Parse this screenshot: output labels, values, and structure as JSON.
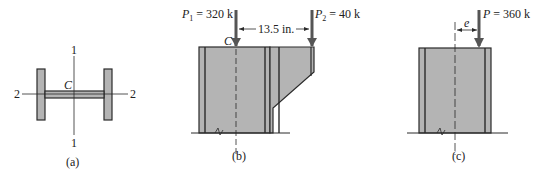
{
  "figure_a": {
    "caption": "(a)",
    "centroid_label": "C",
    "axis1_top": "1",
    "axis1_bottom": "1",
    "axis2_left": "2",
    "axis2_right": "2"
  },
  "figure_b": {
    "caption": "(b)",
    "centroid_label": "C",
    "load1_symbol": "P",
    "load1_sub": "1",
    "load1_value": " = 320 k",
    "load2_symbol": "P",
    "load2_sub": "2",
    "load2_value": " = 40 k",
    "distance": "13.5 in."
  },
  "figure_c": {
    "caption": "(c)",
    "load_symbol": "P",
    "load_value": " = 360 k",
    "eccentricity_label": "e"
  },
  "colors": {
    "fill": "#b4b4b4",
    "stroke": "#2a2a2a"
  }
}
